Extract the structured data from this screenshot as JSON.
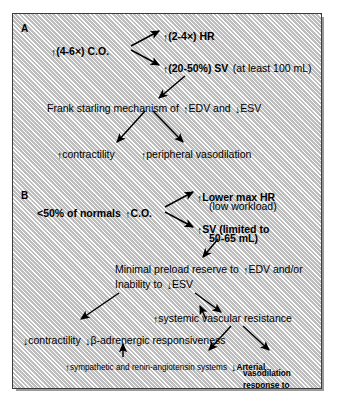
{
  "figure": {
    "panels": [
      {
        "letter": "A",
        "nodes": {
          "co": {
            "arrow": "↑",
            "text": "(4-6×) C.O."
          },
          "hr": {
            "arrow": "↑",
            "text": "(2-4×) HR"
          },
          "sv_bold": {
            "arrow": "↑",
            "text": "(20-50%) SV"
          },
          "sv_note": "(at least 100 mL)",
          "frank_pre": "Frank starling mechanism of",
          "frank_up": "↑",
          "frank_mid": "EDV and",
          "frank_down": "↓",
          "frank_post": "ESV",
          "contractility": {
            "arrow": "↑",
            "text": "contractility"
          },
          "vasodilation": {
            "arrow": "↑",
            "text": "peripheral vasodilation"
          }
        }
      },
      {
        "letter": "B",
        "nodes": {
          "co_pre": "<50% of normals",
          "co_arrow": "↑",
          "co_text": "C.O.",
          "hr_arrow": "↑",
          "hr_text": "Lower max HR",
          "hr_note": "(low workload)",
          "sv_arrow": "↑",
          "sv_text_l1": "SV (limited to",
          "sv_text_l2": "50-65 mL)",
          "preload_l1_pre": "Minimal preload reserve to",
          "preload_l1_up": "↑",
          "preload_l1_post": "EDV and/or",
          "preload_l2_pre": "Inability to",
          "preload_l2_down": "↓",
          "preload_l2_post": "ESV",
          "svr": {
            "arrow": "↑",
            "text": "systemic vascular resistance"
          },
          "contractility": {
            "arrow": "↓",
            "text": "contractility"
          },
          "beta": {
            "arrow": "↓",
            "text": "β-adrenergic responsiveness"
          },
          "sympathetic": {
            "arrow": "↑",
            "text": "sympathetic and renin-angiotensin systems"
          },
          "arterial": {
            "arrow": "↓",
            "l1": "Arterial",
            "l2": "vasodilation",
            "l3": "response to",
            "l4": "exercise"
          }
        }
      }
    ]
  }
}
